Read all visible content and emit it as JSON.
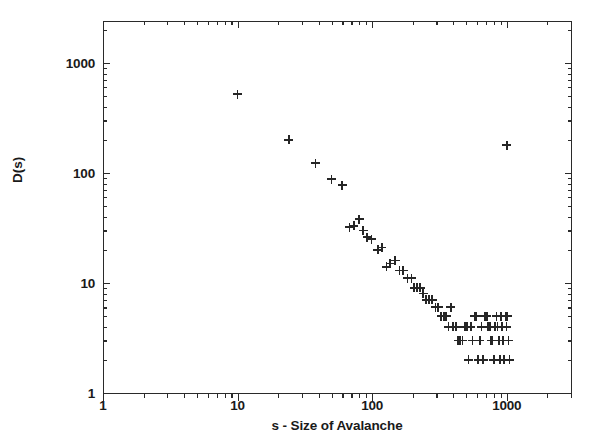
{
  "chart_data": {
    "type": "scatter",
    "title": "",
    "subtitle": "",
    "xlabel": "s - Size of Avalanche",
    "ylabel": "D(s)",
    "xscale": "log",
    "yscale": "log",
    "xlim": [
      1,
      3000
    ],
    "ylim": [
      1,
      2400
    ],
    "grid": false,
    "legend": null,
    "marker": "plus",
    "marker_color": "#262626",
    "xticks": [
      1,
      10,
      100,
      1000
    ],
    "xticklabels": [
      "1",
      "10",
      "100",
      "1000"
    ],
    "yticks": [
      1,
      10,
      100,
      1000
    ],
    "yticklabels": [
      "1",
      "10",
      "100",
      "1000"
    ],
    "series": [
      {
        "name": "D(s)",
        "points": [
          [
            10,
            520
          ],
          [
            24,
            200
          ],
          [
            38,
            123
          ],
          [
            50,
            88
          ],
          [
            60,
            77
          ],
          [
            68,
            32
          ],
          [
            73,
            33
          ],
          [
            80,
            38
          ],
          [
            86,
            30
          ],
          [
            92,
            26
          ],
          [
            99,
            25
          ],
          [
            110,
            20
          ],
          [
            118,
            21
          ],
          [
            128,
            14
          ],
          [
            136,
            15
          ],
          [
            148,
            16
          ],
          [
            160,
            13
          ],
          [
            170,
            13
          ],
          [
            183,
            11
          ],
          [
            196,
            11
          ],
          [
            205,
            9
          ],
          [
            215,
            9
          ],
          [
            228,
            9
          ],
          [
            240,
            8
          ],
          [
            252,
            7
          ],
          [
            265,
            7
          ],
          [
            280,
            7
          ],
          [
            295,
            6
          ],
          [
            310,
            6
          ],
          [
            325,
            5
          ],
          [
            340,
            5
          ],
          [
            355,
            5
          ],
          [
            370,
            4
          ],
          [
            385,
            6
          ],
          [
            400,
            4
          ],
          [
            418,
            4
          ],
          [
            436,
            3
          ],
          [
            452,
            3
          ],
          [
            470,
            3
          ],
          [
            487,
            4
          ],
          [
            505,
            4
          ],
          [
            520,
            2
          ],
          [
            540,
            4
          ],
          [
            556,
            3
          ],
          [
            575,
            5
          ],
          [
            592,
            5
          ],
          [
            612,
            2
          ],
          [
            632,
            3
          ],
          [
            650,
            4
          ],
          [
            668,
            2
          ],
          [
            690,
            5
          ],
          [
            710,
            5
          ],
          [
            728,
            4
          ],
          [
            748,
            4
          ],
          [
            766,
            3
          ],
          [
            785,
            3
          ],
          [
            800,
            2
          ],
          [
            820,
            4
          ],
          [
            838,
            5
          ],
          [
            856,
            4
          ],
          [
            874,
            3
          ],
          [
            890,
            2
          ],
          [
            908,
            5
          ],
          [
            925,
            4
          ],
          [
            942,
            3
          ],
          [
            960,
            2
          ],
          [
            978,
            5
          ],
          [
            995,
            4
          ],
          [
            1010,
            5
          ],
          [
            1030,
            3
          ],
          [
            1050,
            2
          ],
          [
            1000,
            178
          ]
        ]
      }
    ]
  },
  "axes": {
    "x_minor_decades": [
      1,
      10,
      100,
      1000
    ],
    "y_minor_decades": [
      1,
      10,
      100,
      1000
    ]
  }
}
